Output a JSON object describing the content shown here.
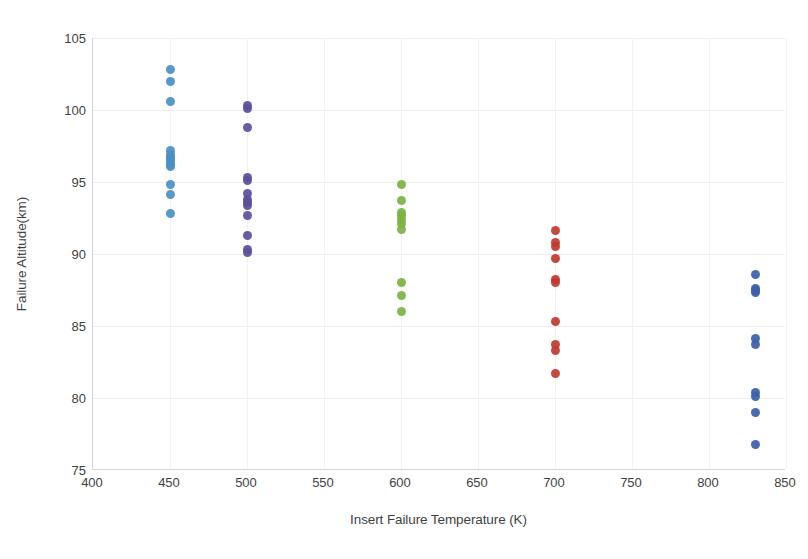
{
  "chart_data": {
    "type": "scatter",
    "title": "",
    "xlabel": "Insert Failure Temperature (K)",
    "ylabel": "Failure Altitude(km)",
    "xlim": [
      400,
      850
    ],
    "ylim": [
      75,
      105
    ],
    "xticks": [
      400,
      450,
      500,
      550,
      600,
      650,
      700,
      750,
      800,
      850
    ],
    "yticks": [
      75,
      80,
      85,
      90,
      95,
      100,
      105
    ],
    "grid": true,
    "legend": "none",
    "series": [
      {
        "name": "450 K",
        "color": "#4a90c4",
        "x": [
          450,
          450,
          450,
          450,
          450,
          450,
          450,
          450,
          450,
          450,
          450,
          450,
          450
        ],
        "y": [
          102.8,
          102.0,
          100.6,
          97.2,
          96.9,
          96.7,
          96.4,
          96.1,
          94.8,
          94.1,
          92.8,
          96.6,
          96.2
        ]
      },
      {
        "name": "500 K",
        "color": "#5b4f9c",
        "x": [
          500,
          500,
          500,
          500,
          500,
          500,
          500,
          500,
          500,
          500,
          500,
          500,
          500
        ],
        "y": [
          100.3,
          100.1,
          98.8,
          95.3,
          95.1,
          94.2,
          93.8,
          93.4,
          92.7,
          91.3,
          90.3,
          90.1,
          93.6
        ]
      },
      {
        "name": "600 K",
        "color": "#7cb342",
        "x": [
          600,
          600,
          600,
          600,
          600,
          600,
          600,
          600,
          600,
          600
        ],
        "y": [
          94.8,
          93.7,
          92.7,
          92.4,
          92.1,
          91.7,
          88.0,
          87.1,
          86.0,
          92.9
        ]
      },
      {
        "name": "700 K",
        "color": "#c0392b",
        "x": [
          700,
          700,
          700,
          700,
          700,
          700,
          700,
          700,
          700,
          700
        ],
        "y": [
          91.6,
          90.8,
          90.5,
          89.7,
          88.2,
          88.0,
          85.3,
          83.7,
          83.3,
          81.7
        ]
      },
      {
        "name": "830 K",
        "color": "#3b5fa8",
        "x": [
          830,
          830,
          830,
          830,
          830,
          830,
          830,
          830,
          830,
          830
        ],
        "y": [
          88.6,
          87.6,
          87.3,
          84.1,
          83.7,
          80.4,
          80.1,
          79.0,
          76.8,
          87.5
        ]
      }
    ]
  },
  "axes": {
    "x_title": "Insert Failure Temperature (K)",
    "y_title": "Failure Altitude(km)",
    "x_tick_labels": [
      "400",
      "450",
      "500",
      "550",
      "600",
      "650",
      "700",
      "750",
      "800",
      "850"
    ],
    "y_tick_labels": [
      "75",
      "80",
      "85",
      "90",
      "95",
      "100",
      "105"
    ]
  },
  "colors": {
    "series_450": "#4a90c4",
    "series_500": "#5b4f9c",
    "series_600": "#7cb342",
    "series_700": "#c0392b",
    "series_830": "#3b5fa8",
    "grid": "#eeeeee",
    "axis": "#d4d4d4",
    "text": "#3f3f3f"
  }
}
